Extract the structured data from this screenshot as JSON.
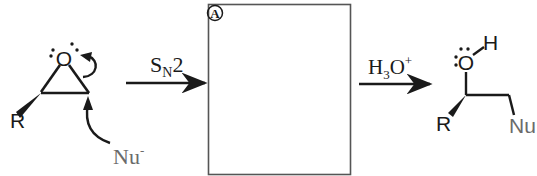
{
  "diagram": {
    "type": "reaction-mechanism",
    "reactant": {
      "name": "epoxide",
      "substituent_label": "R",
      "oxygen_label": "O",
      "nucleophile_label": "Nu",
      "nucleophile_charge": "-"
    },
    "step1": {
      "arrow_label_main": "S",
      "arrow_label_sub": "N",
      "arrow_label_tail": "2"
    },
    "intermediate_box": {
      "label": "A",
      "content": ""
    },
    "step2": {
      "reagent_main": "H",
      "reagent_sub": "3",
      "reagent_tail": "O",
      "reagent_sup": "+"
    },
    "product": {
      "name": "alcohol",
      "oxygen_label": "O",
      "hydrogen_label": "H",
      "substituent_label": "R",
      "nucleophile_label": "Nu"
    },
    "colors": {
      "ink": "#1a1a1a",
      "nu_gray": "#6b6b6b",
      "box_border": "#555555"
    }
  }
}
